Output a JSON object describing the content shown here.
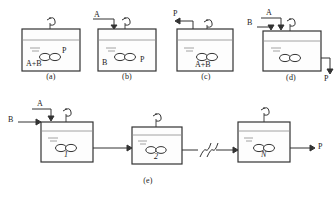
{
  "figure": {
    "panels": [
      {
        "id": "a",
        "caption": "(a)",
        "type": "batch-reactor",
        "inlets": [],
        "outlets": [],
        "inside_labels": [
          {
            "text": "A+B",
            "role": "reactants"
          },
          {
            "text": "P",
            "role": "product"
          }
        ],
        "has_agitator": true,
        "has_liquid_level": true
      },
      {
        "id": "b",
        "caption": "(b)",
        "type": "semibatch-reactor-feed-A",
        "inlets": [
          {
            "text": "A",
            "direction": "down"
          }
        ],
        "outlets": [],
        "inside_labels": [
          {
            "text": "B",
            "role": "reactant"
          },
          {
            "text": "P",
            "role": "product"
          }
        ],
        "has_agitator": true,
        "has_liquid_level": true
      },
      {
        "id": "c",
        "caption": "(c)",
        "type": "semibatch-reactor-remove-P",
        "inlets": [],
        "outlets": [
          {
            "text": "P",
            "direction": "up"
          }
        ],
        "inside_labels": [
          {
            "text": "A+B",
            "role": "reactants"
          }
        ],
        "has_agitator": true,
        "has_liquid_level": true
      },
      {
        "id": "d",
        "caption": "(d)",
        "type": "continuous-stirred-tank-reactor",
        "inlets": [
          {
            "text": "A",
            "direction": "down"
          },
          {
            "text": "B",
            "direction": "right"
          }
        ],
        "outlets": [
          {
            "text": "P",
            "direction": "down"
          }
        ],
        "inside_labels": [],
        "has_agitator": true,
        "has_liquid_level": true
      },
      {
        "id": "e",
        "caption": "(e)",
        "type": "cstr-cascade",
        "inlets": [
          {
            "text": "A",
            "direction": "down"
          },
          {
            "text": "B",
            "direction": "right"
          }
        ],
        "outlets": [
          {
            "text": "P",
            "direction": "right"
          }
        ],
        "stages": [
          {
            "number": "1"
          },
          {
            "number": "2"
          },
          {
            "number": "N"
          }
        ],
        "break_symbol": "//",
        "has_agitator": true,
        "has_liquid_level": true
      }
    ],
    "colors": {
      "line": "#333333",
      "accent": "#8a8a8a",
      "background": "#ffffff"
    }
  }
}
